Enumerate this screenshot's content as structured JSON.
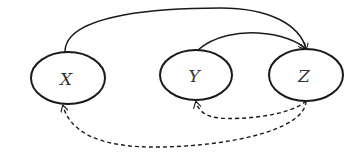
{
  "diagram": {
    "type": "directed-graph",
    "nodes": [
      {
        "id": "X",
        "label": "X",
        "cx": 68,
        "cy": 78,
        "rx": 37,
        "ry": 26
      },
      {
        "id": "Y",
        "label": "Y",
        "cx": 196,
        "cy": 75,
        "rx": 36,
        "ry": 25
      },
      {
        "id": "Z",
        "label": "Z",
        "cx": 306,
        "cy": 75,
        "rx": 37,
        "ry": 26
      }
    ],
    "edges": [
      {
        "from": "X",
        "to": "Z",
        "style": "solid"
      },
      {
        "from": "Y",
        "to": "Z",
        "style": "solid"
      },
      {
        "from": "Z",
        "to": "Y",
        "style": "dashed"
      },
      {
        "from": "Z",
        "to": "X",
        "style": "dashed"
      }
    ],
    "colors": {
      "stroke": "#1a1a1a",
      "text": "#333333",
      "background": "#ffffff"
    }
  }
}
